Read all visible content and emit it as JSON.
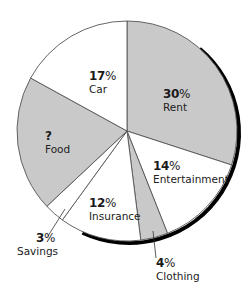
{
  "chart_data": {
    "type": "pie",
    "title": "",
    "start_angle_deg": 0,
    "direction": "clockwise",
    "slices": [
      {
        "name": "Rent",
        "value": 30,
        "label": "30%",
        "fill": "#c9c9c9"
      },
      {
        "name": "Entertainment",
        "value": 14,
        "label": "14%",
        "fill": "#ffffff"
      },
      {
        "name": "Clothing",
        "value": 4,
        "label": "4%",
        "fill": "#c9c9c9"
      },
      {
        "name": "Insurance",
        "value": 12,
        "label": "12%",
        "fill": "#ffffff"
      },
      {
        "name": "Savings",
        "value": 3,
        "label": "3%",
        "fill": "#ffffff"
      },
      {
        "name": "Food",
        "value": 20,
        "label": "?",
        "fill": "#c9c9c9"
      },
      {
        "name": "Car",
        "value": 17,
        "label": "17%",
        "fill": "#ffffff"
      }
    ],
    "unknown_slice": "Food",
    "legend": "none (labels placed on/near slices)"
  },
  "labels": {
    "rent": {
      "pct": "30",
      "sym": "%",
      "name": "Rent"
    },
    "entertainment": {
      "pct": "14",
      "sym": "%",
      "name": "Entertainment"
    },
    "clothing": {
      "pct": "4",
      "sym": "%",
      "name": "Clothing"
    },
    "insurance": {
      "pct": "12",
      "sym": "%",
      "name": "Insurance"
    },
    "savings": {
      "pct": "3",
      "sym": "%",
      "name": "Savings"
    },
    "food": {
      "pct": "?",
      "sym": "",
      "name": "Food"
    },
    "car": {
      "pct": "17",
      "sym": "%",
      "name": "Car"
    }
  },
  "colors": {
    "gray_fill": "#c9c9c9",
    "white_fill": "#ffffff",
    "outline": "#555555",
    "shadow": "#000000"
  }
}
